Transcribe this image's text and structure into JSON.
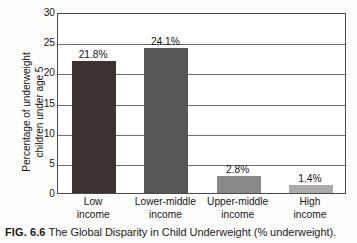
{
  "figure": {
    "caption_number": "FIG. 6.6",
    "caption_text": "The Global Disparity in Child Underweight (% underweight)."
  },
  "chart_data": {
    "type": "bar",
    "title": "",
    "categories": [
      "Low income",
      "Lower-middle income",
      "Upper-middle income",
      "High income"
    ],
    "category_lines": [
      [
        "Low",
        "income"
      ],
      [
        "Lower-middle",
        "income"
      ],
      [
        "Upper-middle",
        "income"
      ],
      [
        "High",
        "income"
      ]
    ],
    "values": [
      21.8,
      24.1,
      2.8,
      1.4
    ],
    "data_labels": [
      "21.8%",
      "24.1%",
      "2.8%",
      "1.4%"
    ],
    "bar_colors": [
      "#3b3330",
      "#575757",
      "#888888",
      "#aaaaaa"
    ],
    "xlabel": "",
    "ylabel_lines": [
      "Percentage of underweight",
      "children under age 5"
    ],
    "ylabel": "Percentage of underweight children under age 5",
    "ylim": [
      0,
      30
    ],
    "yticks": [
      0,
      5,
      10,
      15,
      20,
      25,
      30
    ],
    "ytick_labels": [
      "0",
      "5",
      "10",
      "15",
      "20",
      "25",
      "30"
    ],
    "grid": true,
    "legend": "none",
    "axis_color": "#4a4a4a",
    "grid_color": "#6e6e6e"
  }
}
